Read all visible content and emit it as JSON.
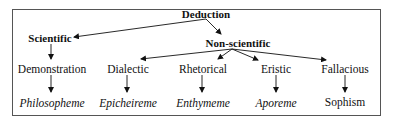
{
  "diagram": {
    "root": {
      "label": "Deduction"
    },
    "level1": [
      {
        "label": "Scientific"
      },
      {
        "label": "Non-scientific"
      }
    ],
    "level2": [
      {
        "label": "Demonstration",
        "parent": "Scientific"
      },
      {
        "label": "Dialectic",
        "parent": "Non-scientific"
      },
      {
        "label": "Rhetorical",
        "parent": "Non-scientific"
      },
      {
        "label": "Eristic",
        "parent": "Non-scientific"
      },
      {
        "label": "Fallacious",
        "parent": "Non-scientific"
      }
    ],
    "level3": [
      {
        "label": "Philosopheme",
        "parent": "Demonstration",
        "italic": true
      },
      {
        "label": "Epicheireme",
        "parent": "Dialectic",
        "italic": true
      },
      {
        "label": "Enthymeme",
        "parent": "Rhetorical",
        "italic": true
      },
      {
        "label": "Aporeme",
        "parent": "Eristic",
        "italic": true
      },
      {
        "label": "Sophism",
        "parent": "Fallacious",
        "italic": false
      }
    ],
    "colors": {
      "line": "#111111",
      "frame": "#555555",
      "text": "#111111"
    }
  }
}
